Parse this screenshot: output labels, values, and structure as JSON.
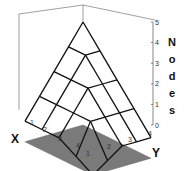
{
  "chart_data": {
    "type": "surface3d",
    "title": "",
    "xlabel": "X",
    "ylabel": "Y",
    "zlabel": "Nodes",
    "x_ticks": [
      "1",
      "2",
      "3",
      "4"
    ],
    "y_ticks": [
      "1",
      "2",
      "3",
      "4"
    ],
    "z_ticks": [
      "0",
      "1",
      "2",
      "3",
      "4",
      "5"
    ],
    "zlim": [
      0,
      5
    ],
    "grid": false,
    "legend": null,
    "base_plane_color": "#7a7a7a",
    "wire_color": "#111111",
    "x": [
      0,
      1,
      2,
      3,
      4
    ],
    "y": [
      0,
      1,
      2,
      3,
      4
    ],
    "z": [
      [
        5,
        4,
        3,
        2,
        1
      ],
      [
        4,
        4,
        3,
        2,
        1
      ],
      [
        3,
        3,
        3,
        2,
        1
      ],
      [
        2,
        2,
        2,
        2,
        0.5
      ],
      [
        1,
        1,
        1,
        0.5,
        0
      ]
    ]
  },
  "labels": {
    "x_axis": "X",
    "y_axis": "Y",
    "z_axis_letters": [
      "N",
      "o",
      "d",
      "e",
      "s"
    ]
  }
}
